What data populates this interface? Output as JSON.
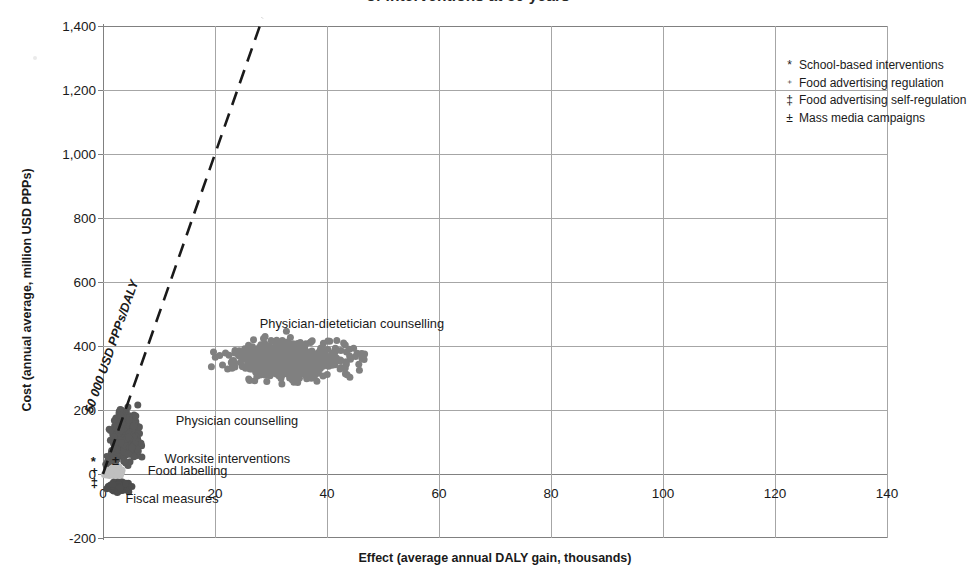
{
  "chart_data": {
    "type": "scatter",
    "title": "of interventions at 50 years",
    "xlabel": "Effect (average annual DALY gain, thousands)",
    "ylabel": "Cost (annual average, million USD PPPs)",
    "xlim": [
      0,
      140
    ],
    "ylim": [
      -200,
      1400
    ],
    "xticks": [
      "0",
      "20",
      "40",
      "60",
      "80",
      "100",
      "120",
      "140"
    ],
    "xtick_values": [
      0,
      20,
      40,
      60,
      80,
      100,
      120,
      140
    ],
    "yticks": [
      "1,400",
      "1,200",
      "1,000",
      "800",
      "600",
      "400",
      "200",
      "0",
      "-200"
    ],
    "ytick_values": [
      1400,
      1200,
      1000,
      800,
      600,
      400,
      200,
      0,
      -200
    ],
    "grid": true,
    "legend_position": "top-right",
    "threshold": {
      "label": "50 000 USD PPPs/DALY",
      "slope_usd_per_daly": 50000,
      "from": [
        0,
        0
      ],
      "to": [
        28.5,
        1425
      ],
      "style": "dashed"
    },
    "series": [
      {
        "name": "Physician-dietetician counselling",
        "color": "#808080",
        "label_x": 28,
        "label_y": 470,
        "center": [
          33,
          355
        ],
        "spread_x": 11,
        "spread_y": 62,
        "n_points": 620,
        "marker_size": 7
      },
      {
        "name": "Physician counselling",
        "color": "#595959",
        "label_x": 13,
        "label_y": 165,
        "center": [
          4.2,
          120
        ],
        "spread_x": 2.4,
        "spread_y": 72,
        "n_points": 430,
        "marker_size": 7
      },
      {
        "name": "Worksite interventions",
        "color": "#595959",
        "label_x": 11,
        "label_y": 48,
        "center": [
          1.6,
          40
        ],
        "spread_x": 1.1,
        "spread_y": 24,
        "n_points": 150,
        "marker_size": 6
      },
      {
        "name": "Food labelling",
        "color": "#bfbfbf",
        "label_x": 8,
        "label_y": 8,
        "center": [
          2.0,
          8
        ],
        "spread_x": 1.5,
        "spread_y": 14,
        "n_points": 130,
        "marker_size": 7
      },
      {
        "name": "Fiscal measures",
        "color": "#4d4d4d",
        "label_x": 4,
        "label_y": -78,
        "center": [
          3.0,
          -40
        ],
        "spread_x": 1.8,
        "spread_y": 16,
        "n_points": 150,
        "marker_size": 7
      }
    ],
    "legend": [
      {
        "symbol": "*",
        "label": "School-based interventions"
      },
      {
        "symbol": "⁺",
        "label": "Food advertising regulation"
      },
      {
        "symbol": "‡",
        "label": "Food advertising self-regulation"
      },
      {
        "symbol": "±",
        "label": "Mass media campaigns"
      }
    ],
    "origin_markers": [
      {
        "symbol": "*",
        "x": -2.2,
        "y": 42
      },
      {
        "symbol": "⁺",
        "x": -2.2,
        "y": 6
      },
      {
        "symbol": "‡",
        "x": -2.2,
        "y": -26
      },
      {
        "symbol": "±",
        "x": 1.6,
        "y": 44
      }
    ]
  }
}
